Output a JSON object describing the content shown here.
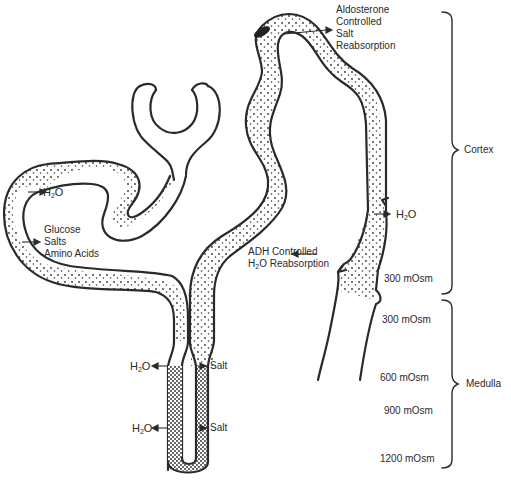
{
  "figure": {
    "type": "nephron-diagram",
    "labels": {
      "aldosterone": [
        "Aldosterone",
        "Controlled",
        "Salt",
        "Reabsorption"
      ],
      "h2o_proximal": {
        "base": "H",
        "sub": "2",
        "rest": "O"
      },
      "proximal_reabsorbed": [
        "Glucose",
        "Salts",
        "Amino  Acids"
      ],
      "h2o_collecting": {
        "base": "H",
        "sub": "2",
        "rest": "O"
      },
      "adh_line1": "ADH Controlled",
      "adh_line2": {
        "base": "H",
        "sub": "2",
        "rest": "O  Reabsorption"
      },
      "loop_h2o_upper": {
        "base": "H",
        "sub": "2",
        "rest": "O"
      },
      "loop_h2o_lower": {
        "base": "H",
        "sub": "2",
        "rest": "O"
      },
      "loop_salt_upper": "Salt",
      "loop_salt_lower": "Salt"
    },
    "osmolarity": [
      {
        "label": "300  mOsm",
        "region": "cortex"
      },
      {
        "label": "300  mOsm",
        "region": "medulla"
      },
      {
        "label": "600  mOsm",
        "region": "medulla"
      },
      {
        "label": "900  mOsm",
        "region": "medulla"
      },
      {
        "label": "1200  mOsm",
        "region": "medulla"
      }
    ],
    "regions": [
      {
        "name": "Cortex"
      },
      {
        "name": "Medulla"
      }
    ],
    "colors": {
      "line": "#2a2a2a",
      "background": "#ffffff"
    }
  }
}
